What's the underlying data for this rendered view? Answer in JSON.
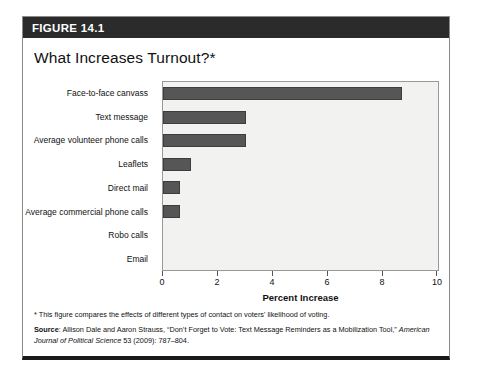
{
  "figure": {
    "header_label": "FIGURE 14.1",
    "title": "What Increases Turnout?*",
    "note": "* This figure compares the effects of different types of contact on voters' likelihood of voting.",
    "source_label": "Source",
    "source_sep": ": ",
    "source_text_1": "Allison Dale and Aaron Strauss, “Don’t Forget to Vote: Text Message Reminders as a Mobilization Tool,” ",
    "source_journal": "American Journal of Political Science",
    "source_text_2": " 53 (2009): 787–804."
  },
  "colors": {
    "header_bar": "#2b2b2b",
    "bar_fill": "#565656",
    "plot_background": "#f2f2f0",
    "frame_border": "#8a8a8a"
  },
  "chart_data": {
    "type": "bar",
    "orientation": "horizontal",
    "title": "What Increases Turnout?*",
    "xlabel": "Percent Increase",
    "ylabel": "",
    "xlim": [
      0,
      10
    ],
    "xticks": [
      0,
      2,
      4,
      6,
      8,
      10
    ],
    "xtick_labels": [
      "0",
      "2",
      "4",
      "6",
      "8",
      "10"
    ],
    "grid": false,
    "legend": null,
    "categories": [
      "Face-to-face canvass",
      "Text message",
      "Average volunteer phone calls",
      "Leaflets",
      "Direct mail",
      "Average commercial phone calls",
      "Robo calls",
      "Email"
    ],
    "values": [
      8.7,
      3.0,
      3.0,
      1.0,
      0.6,
      0.6,
      0.0,
      0.0
    ]
  }
}
